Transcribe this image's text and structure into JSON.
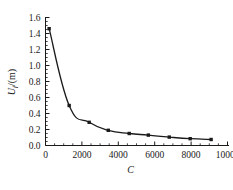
{
  "chart_data": {
    "type": "line",
    "title": "",
    "xlabel": "C",
    "ylabel": "U_f/(m)",
    "ylabel_base": "U",
    "ylabel_sub": "f",
    "ylabel_unit": "/(m)",
    "xlim": [
      0,
      10000
    ],
    "ylim": [
      0.0,
      1.6
    ],
    "x_ticks": [
      0,
      2000,
      4000,
      6000,
      8000,
      10000
    ],
    "x_tick_labels": [
      "0",
      "2000",
      "4000",
      "6000",
      "8000",
      "10000"
    ],
    "x_minor_step": 500,
    "y_ticks": [
      0.0,
      0.2,
      0.4,
      0.6,
      0.8,
      1.0,
      1.2,
      1.4,
      1.6
    ],
    "y_tick_labels": [
      "0.0",
      "0.2",
      "0.4",
      "0.6",
      "0.8",
      "1.0",
      "1.2",
      "1.4",
      "1.6"
    ],
    "y_minor_step": 0.05,
    "grid": false,
    "legend": null,
    "marker": "square",
    "marker_color": "#1a1a1a",
    "line_color": "#1a1a1a",
    "series": [
      {
        "name": "Uf vs C",
        "x": [
          200,
          1300,
          2400,
          3450,
          4600,
          5650,
          6800,
          7950,
          9100
        ],
        "values": [
          1.46,
          0.5,
          0.29,
          0.19,
          0.15,
          0.13,
          0.105,
          0.085,
          0.075
        ]
      }
    ]
  },
  "figure": {
    "caption": ""
  }
}
